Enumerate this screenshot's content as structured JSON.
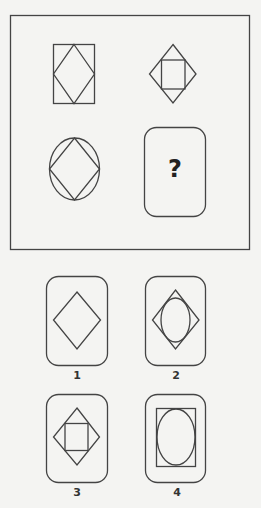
{
  "puzzle": {
    "question_mark": "?",
    "grid": [
      {
        "position": "top-left",
        "shape": "diamond-in-rectangle"
      },
      {
        "position": "top-right",
        "shape": "square-in-diamond"
      },
      {
        "position": "bottom-left",
        "shape": "diamond-in-ellipse"
      },
      {
        "position": "bottom-right",
        "shape": "missing"
      }
    ]
  },
  "options": [
    {
      "label": "1",
      "shape": "diamond"
    },
    {
      "label": "2",
      "shape": "ellipse-in-diamond"
    },
    {
      "label": "3",
      "shape": "square-in-diamond"
    },
    {
      "label": "4",
      "shape": "ellipse-in-rectangle"
    }
  ],
  "colors": {
    "stroke": "#444444",
    "background": "#f4f4f2"
  }
}
